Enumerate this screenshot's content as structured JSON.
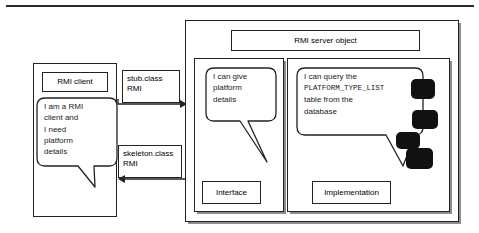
{
  "diagram": {
    "title_rule": "top-divider",
    "client": {
      "title": "RMI client",
      "bubble": "I am a RMI\nclient and\nI need\nplatform\ndetails"
    },
    "channels": {
      "stub": "stub.class\nRMI",
      "skeleton": "skeleton.class\nRMI"
    },
    "server": {
      "title": "RMI server object",
      "interface": {
        "label": "Interface",
        "bubble": "I can give\nplatform\ndetails"
      },
      "implementation": {
        "label": "Implementation",
        "bubble_line1": "I can query the",
        "bubble_table": "PLATFORM_TYPE_LIST",
        "bubble_line3": "table from the",
        "bubble_line4": "database"
      }
    },
    "colors": {
      "stroke": "#222222",
      "blob": "#111111",
      "shadow": "#8d8d8d",
      "background": "#ffffff"
    }
  }
}
